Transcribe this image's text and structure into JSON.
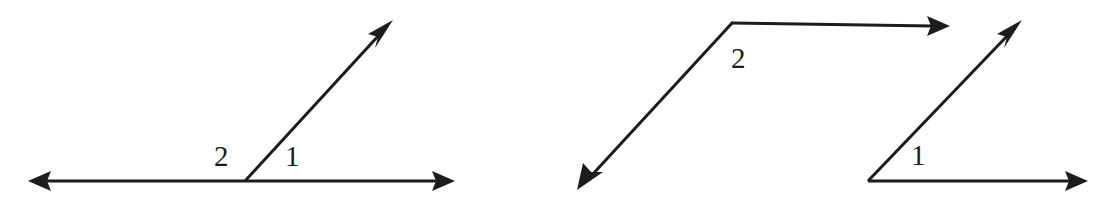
{
  "figure": {
    "background_color": "#ffffff",
    "stroke_color": "#1c1c1c",
    "stroke_width": 3,
    "width": 1103,
    "height": 202,
    "diagrams": [
      {
        "id": "left-diagram",
        "description": "A ray drawn upward to the right from a point on a horizontal line, forming a linear pair of adjacent angles labeled 2 and 1.",
        "vertex": {
          "x": 245,
          "y": 181
        },
        "rays": [
          {
            "name": "baseline-ray-left",
            "from": {
              "x": 245,
              "y": 181
            },
            "to": {
              "x": 28,
              "y": 181
            },
            "arrowhead": true,
            "direction": "left"
          },
          {
            "name": "baseline-ray-right",
            "from": {
              "x": 245,
              "y": 181
            },
            "to": {
              "x": 455,
              "y": 181
            },
            "arrowhead": true,
            "direction": "right"
          },
          {
            "name": "slanted-ray",
            "from": {
              "x": 245,
              "y": 181
            },
            "to": {
              "x": 393,
              "y": 20
            },
            "arrowhead": true,
            "direction": "up-right"
          }
        ],
        "labels": [
          {
            "name": "angle-label-2",
            "text": "2",
            "x": 221,
            "y": 156,
            "side": "left-of-ray"
          },
          {
            "name": "angle-label-1",
            "text": "1",
            "x": 291,
            "y": 156,
            "side": "right-of-ray"
          }
        ]
      },
      {
        "id": "right-diagram",
        "description": "Two separate angles: angle 2 with a down-left ray and a rightward horizontal ray, and angle 1 with an up-right ray and a rightward horizontal ray.",
        "angles": [
          {
            "name": "angle-2",
            "vertex": {
              "x": 733,
              "y": 22
            },
            "rays": [
              {
                "name": "angle-2-ray-down-left",
                "from": {
                  "x": 733,
                  "y": 22
                },
                "to": {
                  "x": 577,
                  "y": 190
                },
                "arrowhead": true,
                "direction": "down-left"
              },
              {
                "name": "angle-2-ray-right",
                "from": {
                  "x": 733,
                  "y": 22
                },
                "to": {
                  "x": 950,
                  "y": 26
                },
                "arrowhead": true,
                "direction": "right"
              }
            ],
            "label": {
              "name": "angle-label-2",
              "text": "2",
              "x": 740,
              "y": 58
            }
          },
          {
            "name": "angle-1",
            "vertex": {
              "x": 868,
              "y": 181
            },
            "rays": [
              {
                "name": "angle-1-ray-up-right",
                "from": {
                  "x": 868,
                  "y": 181
                },
                "to": {
                  "x": 1022,
                  "y": 20
                },
                "arrowhead": true,
                "direction": "up-right"
              },
              {
                "name": "angle-1-ray-right",
                "from": {
                  "x": 868,
                  "y": 181
                },
                "to": {
                  "x": 1088,
                  "y": 181
                },
                "arrowhead": true,
                "direction": "right"
              }
            ],
            "label": {
              "name": "angle-label-1",
              "text": "1",
              "x": 918,
              "y": 155
            }
          }
        ]
      }
    ]
  },
  "labels": {
    "left_angle_2": "2",
    "left_angle_1": "1",
    "right_angle_2": "2",
    "right_angle_1": "1"
  }
}
